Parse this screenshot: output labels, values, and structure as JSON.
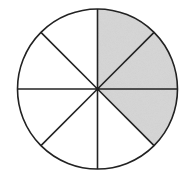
{
  "diagram": {
    "type": "fraction-circle",
    "total_parts": 8,
    "shaded_parts": 3,
    "shaded_sectors": [
      0,
      1,
      2
    ],
    "sector_order": "clockwise from 12 o'clock",
    "fraction_shaded": "3/8",
    "center": [
      97.5,
      89
    ],
    "radius": 80,
    "colors": {
      "background": "#ffffff",
      "stroke": "#222222",
      "shaded_fill": "#d0d0d0",
      "unshaded_fill": "#ffffff"
    },
    "stroke_width": 1.6
  }
}
